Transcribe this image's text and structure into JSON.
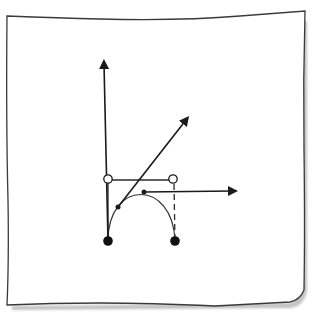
{
  "diagram": {
    "colors": {
      "ink": "#1a1a1a",
      "paper": "#ffffff",
      "paper_border": "#3a3a3a",
      "shadow": "#b8b8b8",
      "curve": "#333333"
    },
    "endpoints": [
      {
        "id": "p0",
        "x": 108,
        "y": 241,
        "style": "filled"
      },
      {
        "id": "p3",
        "x": 175,
        "y": 241,
        "style": "filled"
      }
    ],
    "control_points": [
      {
        "id": "p1",
        "x": 108,
        "y": 179,
        "style": "hollow"
      },
      {
        "id": "p2",
        "x": 173,
        "y": 179,
        "style": "hollow"
      }
    ],
    "curve_points": [
      {
        "id": "q1",
        "x": 118,
        "y": 207,
        "style": "small-filled"
      },
      {
        "id": "q2",
        "x": 144,
        "y": 192,
        "style": "small-filled"
      }
    ],
    "arrows": [
      {
        "id": "vertical-tangent",
        "from": [
          108,
          241
        ],
        "to": [
          104,
          58
        ]
      },
      {
        "id": "diagonal-tangent",
        "from": [
          118,
          207
        ],
        "to": [
          189,
          116
        ]
      },
      {
        "id": "horizontal-tangent",
        "from": [
          144,
          192
        ],
        "to": [
          238,
          192
        ]
      }
    ]
  }
}
